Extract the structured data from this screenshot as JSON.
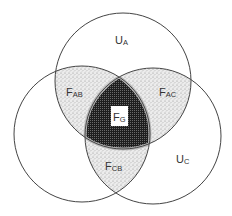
{
  "diagram": {
    "type": "venn-3",
    "circles": [
      {
        "id": "A",
        "cx": 123,
        "cy": 81,
        "r": 68
      },
      {
        "id": "B",
        "cx": 82,
        "cy": 134,
        "r": 68
      },
      {
        "id": "C",
        "cx": 153,
        "cy": 136,
        "r": 68
      }
    ],
    "labels": {
      "ua": {
        "main": "U",
        "sub": "A"
      },
      "uc": {
        "main": "U",
        "sub": "C"
      },
      "fab": {
        "main": "F",
        "sub": "AB"
      },
      "fac": {
        "main": "F",
        "sub": "AC"
      },
      "fcb": {
        "main": "F",
        "sub": "CB"
      },
      "fg": {
        "main": "F",
        "sub": "G"
      }
    },
    "colors": {
      "stroke": "#444444",
      "pairwise_fill": "stippled-light-gray",
      "center_fill": "#2a2a2a",
      "background": "#ffffff"
    }
  }
}
